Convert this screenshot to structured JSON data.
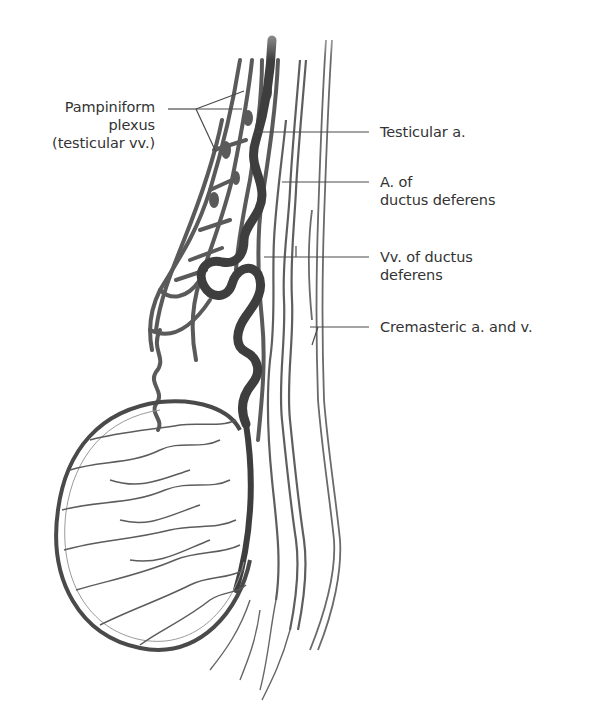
{
  "figure": {
    "type": "anatomical illustration",
    "colors": {
      "vessel": "#555555",
      "vessel_dark": "#3c3c3c",
      "leader": "#4a4a4a",
      "text": "#333333"
    }
  },
  "labels": {
    "pampiniform": {
      "line1": "Pampiniform",
      "line2": "plexus",
      "line3": "(testicular vv.)"
    },
    "testicular_a": {
      "line1": "Testicular a."
    },
    "a_ductus": {
      "line1": "A. of",
      "line2": "ductus deferens"
    },
    "vv_ductus": {
      "line1": "Vv. of ductus",
      "line2": "deferens"
    },
    "cremasteric": {
      "line1": "Cremasteric a. and v."
    }
  }
}
